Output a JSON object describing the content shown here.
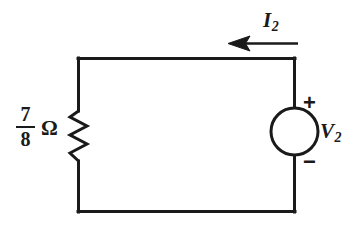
{
  "figure": {
    "type": "circuit-schematic",
    "background_color": "#ffffff",
    "line_color": "#1a1a1a"
  },
  "resistor": {
    "value_numerator": "7",
    "value_denominator": "8",
    "unit_symbol": "Ω",
    "element_name": "resistor-zigzag"
  },
  "source": {
    "element_name": "voltage-source",
    "label": "V",
    "label_subscript": "2",
    "polarity_top": "+",
    "polarity_bottom": "−"
  },
  "current": {
    "label": "I",
    "label_subscript": "2",
    "direction": "left",
    "arrow_name": "current-arrow"
  },
  "wires": {
    "top": "top-wire",
    "bottom": "bottom-wire",
    "left": "left-wire",
    "right": "right-wire"
  }
}
